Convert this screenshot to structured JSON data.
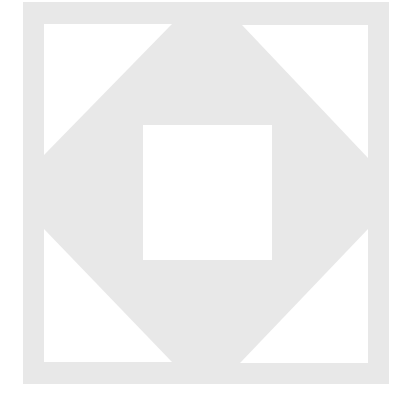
{
  "image": {
    "description": "Geometric quilt-block pattern: light gray square with white corner triangles and a white center square",
    "colors": {
      "background": "#ffffff",
      "block": "#e8e8e8",
      "cutout": "#ffffff"
    },
    "block": {
      "x": 23,
      "y": 2,
      "w": 366,
      "h": 382
    },
    "center_square": {
      "x": 143,
      "y": 125,
      "w": 129,
      "h": 135
    },
    "triangles": {
      "top_left": "44,24 172,24 44,155",
      "top_right": "242,25 368,25 368,158",
      "bottom_left": "44,229 44,362 172,362",
      "bottom_right": "368,229 368,363 240,363"
    }
  }
}
